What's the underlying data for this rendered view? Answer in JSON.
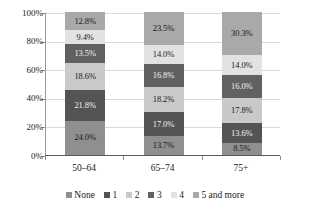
{
  "chart_data": {
    "type": "bar",
    "subtype": "stacked-percent",
    "title": "",
    "subtitle": "",
    "xlabel": "",
    "ylabel": "",
    "categories": [
      "50–64",
      "65–74",
      "75+"
    ],
    "ylim": [
      0,
      100
    ],
    "y_tick_labels": [
      "0%",
      "20%",
      "40%",
      "60%",
      "80%",
      "100%"
    ],
    "y_tick_values": [
      0,
      20,
      40,
      60,
      80,
      100
    ],
    "grid": true,
    "legend_position": "bottom",
    "value_suffix": "%",
    "series": [
      {
        "name": "None",
        "color": "#8f8f8f",
        "label_color": "dark",
        "values": [
          24.0,
          13.7,
          8.5
        ],
        "labels": [
          "24.0%",
          "13.7%",
          "8.5%"
        ]
      },
      {
        "name": "1",
        "color": "#545454",
        "label_color": "light",
        "values": [
          21.8,
          17.0,
          13.6
        ],
        "labels": [
          "21.8%",
          "17.0%",
          "13.6%"
        ]
      },
      {
        "name": "2",
        "color": "#c9c9c9",
        "label_color": "dark",
        "values": [
          18.6,
          18.2,
          17.8
        ],
        "labels": [
          "18.6%",
          "18.2%",
          "17.8%"
        ]
      },
      {
        "name": "3",
        "color": "#616161",
        "label_color": "light",
        "values": [
          13.5,
          16.8,
          16.0
        ],
        "labels": [
          "13.5%",
          "16.8%",
          "16.0%"
        ]
      },
      {
        "name": "4",
        "color": "#e2e2e2",
        "label_color": "dark",
        "values": [
          9.4,
          14.0,
          14.0
        ],
        "labels": [
          "9.4%",
          "14.0%",
          "14.0%"
        ]
      },
      {
        "name": "5 and more",
        "color": "#a9a9a9",
        "label_color": "dark",
        "values": [
          12.8,
          23.5,
          30.3
        ],
        "labels": [
          "12.8%",
          "23.5%",
          "30.3%"
        ]
      }
    ]
  },
  "legend": {
    "items": [
      {
        "label": "None",
        "color": "#8f8f8f"
      },
      {
        "label": "1",
        "color": "#545454"
      },
      {
        "label": "2",
        "color": "#c9c9c9"
      },
      {
        "label": "3",
        "color": "#616161"
      },
      {
        "label": "4",
        "color": "#e2e2e2"
      },
      {
        "label": "5 and more",
        "color": "#a9a9a9"
      }
    ]
  },
  "axes": {
    "y_labels": [
      "100%",
      "80%",
      "60%",
      "40%",
      "20%",
      "0%"
    ],
    "x_labels": [
      "50–64",
      "65–74",
      "75+"
    ]
  }
}
